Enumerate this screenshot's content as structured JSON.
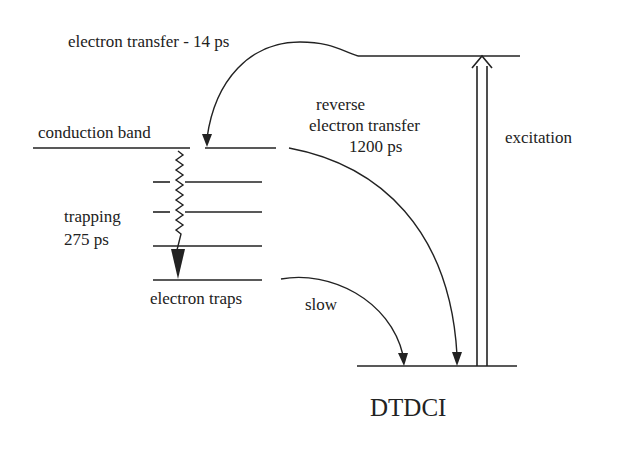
{
  "diagram": {
    "type": "energy-level diagram",
    "colors": {
      "ink": "#222222",
      "background": "#ffffff"
    },
    "labels": {
      "electron_transfer": "electron transfer - 14 ps",
      "conduction_band": "conduction band",
      "reverse_line1": "reverse",
      "reverse_line2": "electron transfer",
      "reverse_line3": "1200 ps",
      "excitation": "excitation",
      "trapping_line1": "trapping",
      "trapping_line2": "275 ps",
      "electron_traps": "electron traps",
      "slow": "slow",
      "molecule": "DTDCI"
    },
    "levels": [
      {
        "name": "DTDCI excited state"
      },
      {
        "name": "conduction band"
      },
      {
        "name": "trap level 1"
      },
      {
        "name": "trap level 2"
      },
      {
        "name": "trap level 3"
      },
      {
        "name": "electron traps"
      },
      {
        "name": "DTDCI ground state"
      }
    ],
    "transitions": [
      {
        "from": "DTDCI excited state",
        "to": "conduction band",
        "label": "electron transfer - 14 ps"
      },
      {
        "from": "conduction band",
        "to": "electron traps",
        "label": "trapping 275 ps",
        "style": "wavy"
      },
      {
        "from": "conduction band",
        "to": "DTDCI ground state",
        "label": "reverse electron transfer 1200 ps"
      },
      {
        "from": "electron traps",
        "to": "DTDCI ground state",
        "label": "slow"
      },
      {
        "from": "DTDCI ground state",
        "to": "DTDCI excited state",
        "label": "excitation",
        "style": "double-line arrow"
      }
    ]
  }
}
